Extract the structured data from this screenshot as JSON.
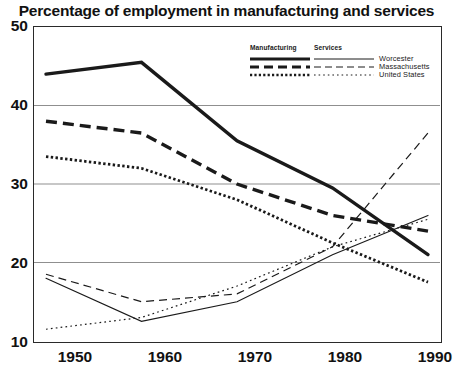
{
  "chart_data": {
    "type": "line",
    "title": "Percentage of employment in manufacturing and services",
    "xlabel": "",
    "ylabel": "",
    "x": [
      1950,
      1960,
      1970,
      1980,
      1990
    ],
    "xticks": [
      "1950",
      "1960",
      "1970",
      "1980",
      "1990"
    ],
    "yticks": [
      "10",
      "20",
      "30",
      "40",
      "50"
    ],
    "ylim": [
      10,
      50
    ],
    "xlim": [
      1950,
      1990
    ],
    "grid": "horizontal",
    "legend_position": "top-right",
    "legend_group_headers": [
      "Manufacturing",
      "Services"
    ],
    "legend_row_labels": [
      "Worcester",
      "Massachusetts",
      "United States"
    ],
    "series": [
      {
        "name": "Worcester",
        "category": "Manufacturing",
        "style": "solid-thick",
        "values": [
          44.0,
          45.5,
          35.5,
          29.5,
          21.0
        ]
      },
      {
        "name": "Massachusetts",
        "category": "Manufacturing",
        "style": "dashed-thick",
        "values": [
          38.0,
          36.5,
          30.0,
          26.0,
          24.0
        ]
      },
      {
        "name": "United States",
        "category": "Manufacturing",
        "style": "dotted-thick",
        "values": [
          33.5,
          32.0,
          28.0,
          22.5,
          17.5
        ]
      },
      {
        "name": "Worcester",
        "category": "Services",
        "style": "solid-thin",
        "values": [
          18.0,
          12.5,
          15.0,
          21.0,
          26.0
        ]
      },
      {
        "name": "Massachusetts",
        "category": "Services",
        "style": "dashed-thin",
        "values": [
          18.5,
          15.0,
          16.0,
          22.0,
          36.5
        ]
      },
      {
        "name": "United States",
        "category": "Services",
        "style": "dotted-thin",
        "values": [
          11.5,
          13.0,
          17.0,
          22.0,
          25.5
        ]
      }
    ],
    "colors": {
      "line": "#1a1a1a",
      "grid": "#8f8f8f",
      "axis": "#2a2a2a",
      "background": "#ffffff"
    }
  },
  "axes": {
    "y_labels": [
      "50",
      "40",
      "30",
      "20",
      "10"
    ],
    "x_labels": [
      "1950",
      "1960",
      "1970",
      "1980",
      "1990"
    ]
  },
  "legend": {
    "headers": {
      "manufacturing": "Manufacturing",
      "services": "Services"
    },
    "rows": [
      {
        "label": "Worcester"
      },
      {
        "label": "Massachusetts"
      },
      {
        "label": "United States"
      }
    ]
  }
}
